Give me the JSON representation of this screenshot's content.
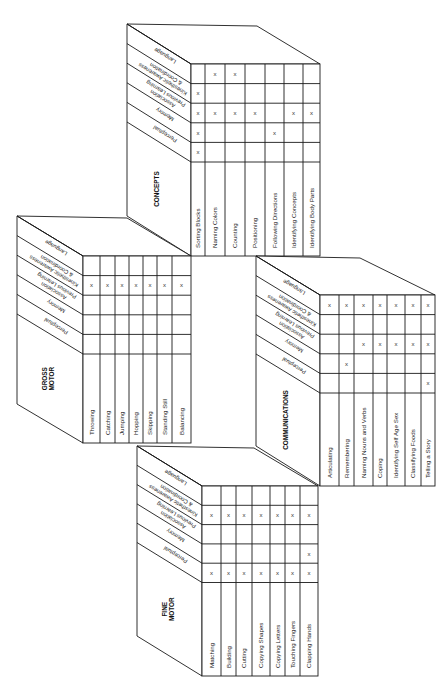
{
  "figure": {
    "factors": [
      "Language",
      "Kinesthetic Awareness & Coordination",
      "Association Previous Learning",
      "Memory",
      "Perceptual"
    ],
    "factor_labels": [
      [
        "Language"
      ],
      [
        "Kinesthetic Awareness",
        "& Coordination"
      ],
      [
        "Association",
        "Previous Learning"
      ],
      [
        "Memory"
      ],
      [
        "Perceptual"
      ]
    ],
    "mark_symbol": "x",
    "line_color": "#1a1a1a",
    "background": "#ffffff"
  },
  "blocks": [
    {
      "id": "concepts",
      "title": [
        "CONCEPTS"
      ],
      "skills": [
        "Sorting Blocks",
        "Naming Colors",
        "Counting",
        "Positioning",
        "Following Directions",
        "Identifying Concepts",
        "Identifying Body Parts"
      ],
      "marks": {
        "Language": [
          0,
          1,
          1,
          0,
          0,
          0,
          0
        ],
        "Kinesthetic Awareness & Coordination": [
          1,
          0,
          0,
          0,
          0,
          0,
          0
        ],
        "Association Previous Learning": [
          1,
          1,
          1,
          1,
          0,
          1,
          1
        ],
        "Memory": [
          1,
          0,
          0,
          0,
          1,
          0,
          0
        ],
        "Perceptual": [
          1,
          0,
          0,
          0,
          0,
          0,
          0
        ]
      },
      "geom": {
        "lx": 127,
        "ty": 24,
        "gx": 191,
        "gy": 64,
        "gr": 320,
        "backx": 257,
        "cols": [
          191,
          205,
          225,
          245,
          265,
          284,
          303,
          320
        ],
        "rowH": 19.6,
        "labelBottom": 256,
        "faceBottomLeft": 216
      }
    },
    {
      "id": "gross-motor",
      "title": [
        "GROSS",
        "MOTOR"
      ],
      "skills": [
        "Throwing",
        "Catching",
        "Jumping",
        "Hopping",
        "Skipping",
        "Standing Still",
        "Balancing"
      ],
      "marks": {
        "Language": [
          0,
          0,
          0,
          0,
          0,
          0,
          0
        ],
        "Kinesthetic Awareness & Coordination": [
          1,
          1,
          1,
          1,
          1,
          1,
          1
        ],
        "Association Previous Learning": [
          0,
          0,
          0,
          0,
          0,
          0,
          0
        ],
        "Memory": [
          0,
          0,
          0,
          0,
          0,
          0,
          0
        ],
        "Perceptual": [
          0,
          0,
          0,
          0,
          0,
          0,
          0
        ]
      },
      "geom": {
        "lx": 17,
        "ty": 216,
        "gx": 83,
        "gy": 256,
        "gr": 191,
        "backx": 127,
        "cols": [
          83,
          100,
          115,
          129,
          143,
          157,
          172,
          191
        ],
        "rowH": 19.6,
        "labelBottom": 443,
        "faceBottomLeft": 404
      }
    },
    {
      "id": "communications",
      "title": [
        "COMMUNICATIONS"
      ],
      "skills": [
        "Articulating",
        "Remembering",
        "Naming Nouns and Verbs",
        "Coping",
        "Identifying Self Age Sex",
        "Classifying Foods",
        "Telling a Story"
      ],
      "marks": {
        "Language": [
          1,
          1,
          1,
          1,
          1,
          1,
          1
        ],
        "Kinesthetic Awareness & Coordination": [
          0,
          0,
          0,
          0,
          0,
          0,
          0
        ],
        "Association Previous Learning": [
          0,
          0,
          1,
          1,
          1,
          1,
          1
        ],
        "Memory": [
          0,
          1,
          0,
          0,
          0,
          0,
          0
        ],
        "Perceptual": [
          0,
          0,
          0,
          0,
          0,
          0,
          1
        ]
      },
      "geom": {
        "lx": 256,
        "ty": 256,
        "gx": 320,
        "gy": 295,
        "gr": 435,
        "backx": 360,
        "cols": [
          320,
          339,
          354,
          373,
          387,
          405,
          421,
          435
        ],
        "rowH": 19.6,
        "labelBottom": 486,
        "faceBottomLeft": 446
      }
    },
    {
      "id": "fine-motor",
      "title": [
        "FINE",
        "MOTOR"
      ],
      "skills": [
        "Matching",
        "Building",
        "Cutting",
        "Copying Shapes",
        "Copying Letters",
        "Touching Fingers",
        "Clapping Hands"
      ],
      "marks": {
        "Language": [
          0,
          0,
          0,
          0,
          0,
          0,
          0
        ],
        "Kinesthetic Awareness & Coordination": [
          1,
          1,
          1,
          1,
          1,
          1,
          1
        ],
        "Association Previous Learning": [
          0,
          0,
          0,
          0,
          0,
          0,
          0
        ],
        "Memory": [
          0,
          0,
          0,
          0,
          0,
          0,
          1
        ],
        "Perceptual": [
          1,
          1,
          1,
          1,
          1,
          1,
          1
        ]
      },
      "geom": {
        "lx": 137,
        "ty": 446,
        "gx": 202,
        "gy": 486,
        "gr": 318,
        "backx": 254,
        "cols": [
          202,
          221,
          236,
          252,
          270,
          285,
          300,
          318
        ],
        "rowH": 19.3,
        "labelBottom": 676,
        "faceBottomLeft": 636
      }
    }
  ]
}
